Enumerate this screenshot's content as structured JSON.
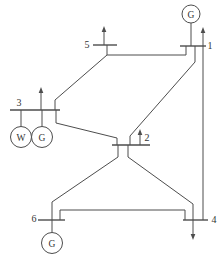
{
  "diagram": {
    "canvas": {
      "width": 222,
      "height": 263,
      "background": "#ffffff"
    },
    "style": {
      "line_color": "#4d4d4d",
      "text_color": "#333333",
      "line_width": 1,
      "bus_bar_width": 1.4,
      "arrow_head_length": 6,
      "arrow_head_half_width": 2.3
    },
    "buses": [
      {
        "id": "1",
        "label": "1",
        "label_x": 210,
        "label_y": 45,
        "x1": 180,
        "x2": 206,
        "y": 46
      },
      {
        "id": "2",
        "label": "2",
        "label_x": 147,
        "label_y": 137,
        "x1": 112,
        "x2": 150,
        "y": 145
      },
      {
        "id": "3",
        "label": "3",
        "label_x": 19,
        "label_y": 102,
        "x1": 10,
        "x2": 60,
        "y": 110
      },
      {
        "id": "4",
        "label": "4",
        "label_x": 214,
        "label_y": 219,
        "x1": 183,
        "x2": 208,
        "y": 220
      },
      {
        "id": "5",
        "label": "5",
        "label_x": 87,
        "label_y": 44,
        "x1": 93,
        "x2": 117,
        "y": 45
      },
      {
        "id": "6",
        "label": "6",
        "label_x": 34,
        "label_y": 218,
        "x1": 38,
        "x2": 65,
        "y": 220
      }
    ],
    "generators": [
      {
        "name": "generator-bus1",
        "letter": "G",
        "cx": 191,
        "cy": 14,
        "r": 9,
        "lead": [
          [
            191,
            23
          ],
          [
            191,
            46
          ]
        ]
      },
      {
        "name": "wind-unit-bus3",
        "letter": "W",
        "cx": 21,
        "cy": 137,
        "r": 10.5,
        "lead": [
          [
            21,
            126.5
          ],
          [
            21,
            110
          ]
        ]
      },
      {
        "name": "generator-bus3",
        "letter": "G",
        "cx": 42,
        "cy": 137,
        "r": 10.5,
        "lead": [
          [
            42,
            126.5
          ],
          [
            42,
            110
          ]
        ]
      },
      {
        "name": "generator-bus6",
        "letter": "G",
        "cx": 52,
        "cy": 243,
        "r": 10.5,
        "lead": [
          [
            52,
            232.5
          ],
          [
            52,
            220
          ]
        ]
      }
    ],
    "lines": [
      {
        "name": "line-5-1",
        "points": [
          [
            107,
            45
          ],
          [
            107,
            55
          ],
          [
            186,
            55
          ],
          [
            186,
            46
          ]
        ]
      },
      {
        "name": "line-5-3",
        "points": [
          [
            107,
            55
          ],
          [
            55,
            100
          ],
          [
            55,
            110
          ]
        ]
      },
      {
        "name": "line-1-2",
        "points": [
          [
            195,
            46
          ],
          [
            195,
            62
          ],
          [
            130,
            136
          ],
          [
            130,
            145
          ]
        ]
      },
      {
        "name": "line-1-4",
        "points": [
          [
            203,
            46
          ],
          [
            203,
            220
          ]
        ]
      },
      {
        "name": "line-3-2",
        "points": [
          [
            56,
            110
          ],
          [
            56,
            123
          ],
          [
            117,
            138
          ],
          [
            117,
            145
          ]
        ]
      },
      {
        "name": "line-2-6",
        "points": [
          [
            118,
            145
          ],
          [
            118,
            157
          ],
          [
            52,
            202
          ],
          [
            52,
            220
          ]
        ]
      },
      {
        "name": "line-2-4",
        "points": [
          [
            128,
            145
          ],
          [
            128,
            157
          ],
          [
            193,
            204
          ],
          [
            193,
            220
          ]
        ]
      },
      {
        "name": "line-6-4",
        "points": [
          [
            60,
            220
          ],
          [
            60,
            210
          ],
          [
            185,
            210
          ],
          [
            185,
            220
          ]
        ]
      }
    ],
    "arrows": [
      {
        "name": "load-arrow-bus5",
        "tail": [
          104,
          45
        ],
        "tip": [
          104,
          26
        ]
      },
      {
        "name": "load-arrow-bus3",
        "tail": [
          41,
          110
        ],
        "tip": [
          41,
          87
        ]
      },
      {
        "name": "load-arrow-bus2",
        "tail": [
          140,
          145
        ],
        "tip": [
          140,
          129
        ]
      },
      {
        "name": "load-arrow-bus1",
        "tail": [
          203,
          46
        ],
        "tip": [
          203,
          27
        ]
      },
      {
        "name": "load-arrow-bus4",
        "tail": [
          193,
          220
        ],
        "tip": [
          193,
          240
        ]
      }
    ]
  }
}
